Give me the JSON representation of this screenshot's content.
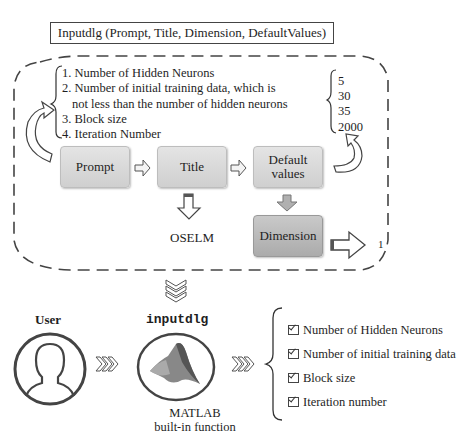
{
  "header": {
    "function_signature": "Inputdlg (Prompt, Title, Dimension, DefaultValues)"
  },
  "prompt_list": {
    "items": [
      "1. Number of Hidden Neurons",
      "2. Number of initial training data, which is",
      "not less than the number of hidden neurons",
      "3. Block size",
      "4. Iteration Number"
    ]
  },
  "default_values": {
    "items": [
      "5",
      "30",
      "35",
      "2000"
    ]
  },
  "flow": {
    "prompt_label": "Prompt",
    "title_label": "Title",
    "default_values_line1": "Default",
    "default_values_line2": "values",
    "dimension_label": "Dimension",
    "title_output": "OSELM",
    "dimension_output": "1"
  },
  "bottom": {
    "user_label": "User",
    "function_name": "inputdlg",
    "matlab_line1": "MATLAB",
    "matlab_line2": "built-in function",
    "outputs": [
      "Number of Hidden Neurons",
      "Number of initial training data",
      "Block size",
      "Iteration number"
    ]
  },
  "colors": {
    "light_box": "#d9d9d9",
    "dark_box": "#b8b8b8",
    "stroke": "#444444",
    "matlab_orange": "#c0392b"
  }
}
